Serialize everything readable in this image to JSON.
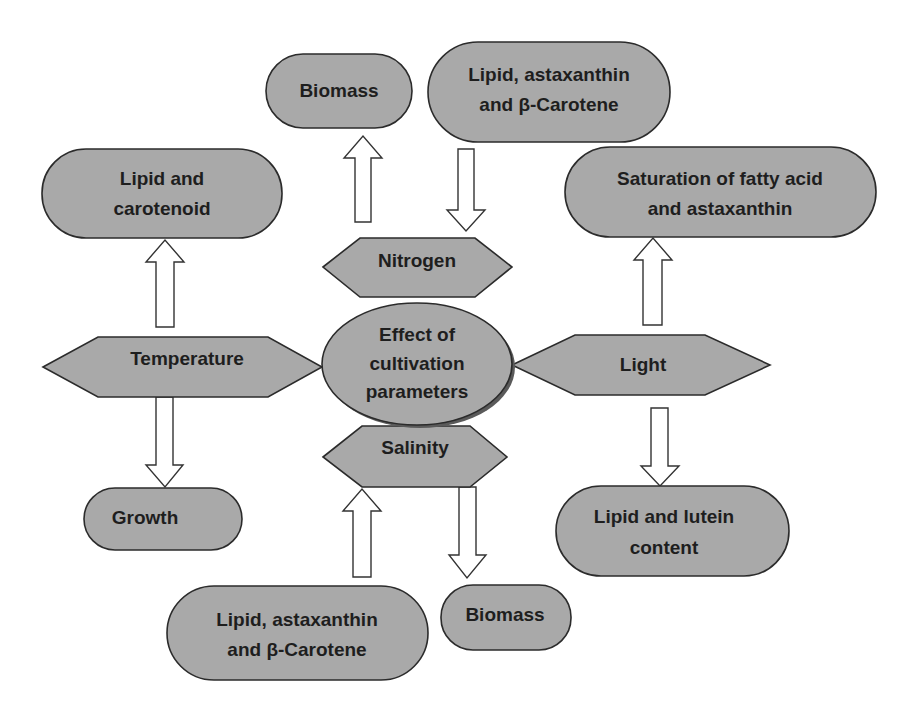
{
  "diagram": {
    "title": "Effect of cultivation parameters",
    "colors": {
      "node_fill": "#a9a9a9",
      "node_stroke": "#2b2b2b",
      "arrow_fill": "#ffffff",
      "text": "#1e1e1e",
      "background": "#ffffff"
    },
    "center": {
      "lines": [
        "Effect of",
        "cultivation",
        "parameters"
      ]
    },
    "parameters": {
      "nitrogen": "Nitrogen",
      "temperature": "Temperature",
      "light": "Light",
      "salinity": "Salinity"
    },
    "outcomes": {
      "nitrogen_up": {
        "lines": [
          "Biomass"
        ]
      },
      "nitrogen_down": {
        "lines": [
          "Lipid, astaxanthin",
          "and β-Carotene"
        ]
      },
      "temperature_up": {
        "lines": [
          "Lipid and",
          "carotenoid"
        ]
      },
      "temperature_down": {
        "lines": [
          "Growth"
        ]
      },
      "light_up": {
        "lines": [
          "Saturation of fatty acid",
          "and astaxanthin"
        ]
      },
      "light_down": {
        "lines": [
          "Lipid and lutein",
          "content"
        ]
      },
      "salinity_up": {
        "lines": [
          "Lipid, astaxanthin",
          "and β-Carotene"
        ]
      },
      "salinity_down": {
        "lines": [
          "Biomass"
        ]
      }
    },
    "edges": [
      {
        "from": "nitrogen",
        "to": "nitrogen_up",
        "direction": "up"
      },
      {
        "from": "nitrogen_down",
        "to": "nitrogen",
        "direction": "down"
      },
      {
        "from": "temperature",
        "to": "temperature_up",
        "direction": "up"
      },
      {
        "from": "temperature",
        "to": "temperature_down",
        "direction": "down"
      },
      {
        "from": "light",
        "to": "light_up",
        "direction": "up"
      },
      {
        "from": "light",
        "to": "light_down",
        "direction": "down"
      },
      {
        "from": "salinity_up",
        "to": "salinity",
        "direction": "up"
      },
      {
        "from": "salinity",
        "to": "salinity_down",
        "direction": "down"
      }
    ]
  }
}
